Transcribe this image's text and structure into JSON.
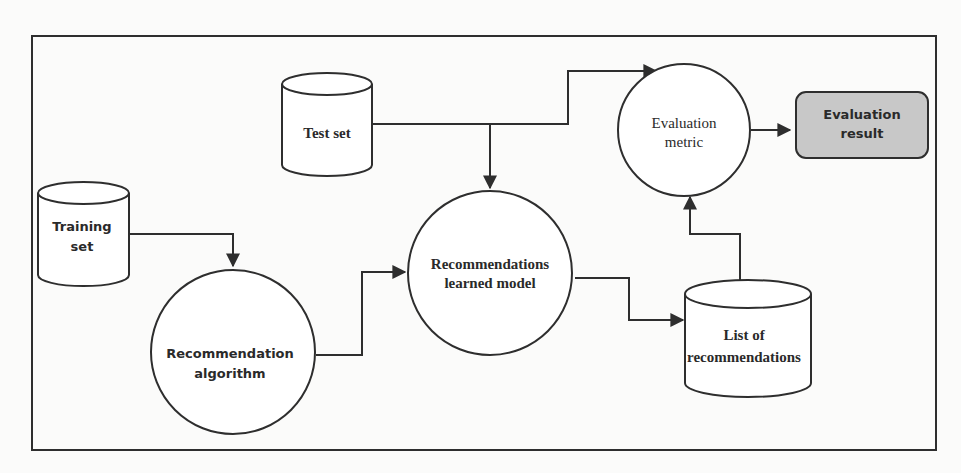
{
  "diagram": {
    "title": "",
    "nodes": {
      "test_set": {
        "type": "cylinder",
        "label": "Test set"
      },
      "training_set": {
        "type": "cylinder",
        "label_line1": "Training",
        "label_line2": "set"
      },
      "recommendation_algorithm": {
        "type": "circle",
        "label_line1": "Recommendation",
        "label_line2": "algorithm"
      },
      "recommendations_learned_model": {
        "type": "circle",
        "label_line1": "Recommendations",
        "label_line2": "learned model"
      },
      "list_of_recommendations": {
        "type": "cylinder",
        "label_line1": "List of",
        "label_line2": "recommendations"
      },
      "evaluation_metric": {
        "type": "circle",
        "label_line1": "Evaluation",
        "label_line2": "metric"
      },
      "evaluation_result": {
        "type": "rounded-box",
        "label_line1": "Evaluation",
        "label_line2": "result",
        "fill": "#c8c8c8"
      }
    },
    "edges": [
      {
        "from": "Training set",
        "to": "Recommendation algorithm"
      },
      {
        "from": "Recommendation algorithm",
        "to": "Recommendations learned model"
      },
      {
        "from": "Test set",
        "to": "Recommendations learned model"
      },
      {
        "from": "Test set",
        "to": "Evaluation metric"
      },
      {
        "from": "Recommendations learned model",
        "to": "List of recommendations"
      },
      {
        "from": "List of recommendations",
        "to": "Evaluation metric"
      },
      {
        "from": "Evaluation metric",
        "to": "Evaluation result"
      }
    ],
    "colors": {
      "line": "#2e2e2e",
      "background": "#fbfbfa",
      "result_fill": "#c8c8c8"
    }
  }
}
